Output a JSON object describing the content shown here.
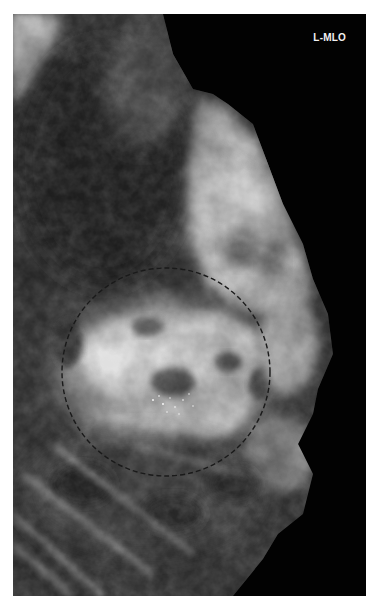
{
  "image": {
    "type": "mammogram",
    "view_label": "L-MLO",
    "laterality": "L",
    "projection": "MLO",
    "annotation": {
      "shape": "dashed-circle",
      "center_px": [
        166,
        372
      ],
      "radius_px": 104,
      "color": "#1a1a1a"
    },
    "colors": {
      "background": "#020202",
      "page": "#ffffff",
      "label": "#f2f2f2"
    }
  }
}
